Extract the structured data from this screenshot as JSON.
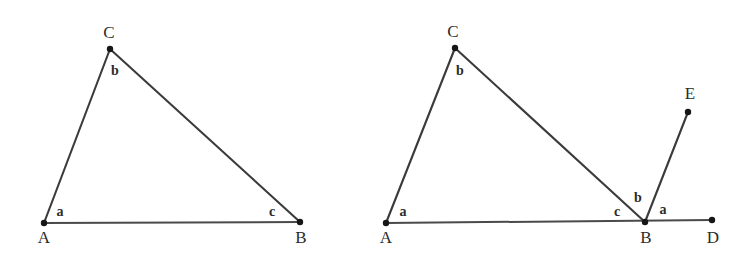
{
  "page": {
    "background_color": "#ffffff",
    "width": 754,
    "height": 260,
    "line_color": "#3b3b3b",
    "label_color": "#2b2b2b",
    "dot_color": "#161616"
  },
  "chart_data": {
    "type": "diagram",
    "title": "",
    "figures": [
      {
        "id": "figure-left",
        "name": "triangle-abc",
        "points": [
          {
            "id": "A",
            "label": "A",
            "x": 44,
            "y": 223,
            "label_x": 44,
            "label_y": 243,
            "dot": true
          },
          {
            "id": "B",
            "label": "B",
            "x": 300,
            "y": 222,
            "label_x": 301,
            "label_y": 243,
            "dot": true
          },
          {
            "id": "C",
            "label": "C",
            "x": 110,
            "y": 49,
            "label_x": 109,
            "label_y": 38,
            "dot": true
          }
        ],
        "segments": [
          {
            "id": "AC",
            "from": "A",
            "to": "C",
            "style": "seg"
          },
          {
            "id": "CB",
            "from": "C",
            "to": "B",
            "style": "seg"
          },
          {
            "id": "AB",
            "from": "A",
            "to": "B",
            "style": "baseline"
          }
        ],
        "angle_labels": [
          {
            "id": "left-angle-a",
            "text": "a",
            "x": 60,
            "y": 216
          },
          {
            "id": "left-angle-b",
            "text": "b",
            "x": 115,
            "y": 75
          },
          {
            "id": "left-angle-c",
            "text": "c",
            "x": 272,
            "y": 216
          }
        ]
      },
      {
        "id": "figure-right",
        "name": "triangle-abc-with-exterior-angle",
        "points": [
          {
            "id": "A",
            "label": "A",
            "x": 386,
            "y": 223,
            "label_x": 386,
            "label_y": 243,
            "dot": true
          },
          {
            "id": "B",
            "label": "B",
            "x": 645,
            "y": 222,
            "label_x": 646,
            "label_y": 243,
            "dot": true
          },
          {
            "id": "C",
            "label": "C",
            "x": 455,
            "y": 48,
            "label_x": 453,
            "label_y": 37,
            "dot": true
          },
          {
            "id": "D",
            "label": "D",
            "x": 712,
            "y": 220,
            "label_x": 713,
            "label_y": 243,
            "dot": true
          },
          {
            "id": "E",
            "label": "E",
            "x": 688,
            "y": 112,
            "label_x": 690,
            "label_y": 99,
            "dot": true
          }
        ],
        "segments": [
          {
            "id": "AC",
            "from": "A",
            "to": "C",
            "style": "seg"
          },
          {
            "id": "CB",
            "from": "C",
            "to": "B",
            "style": "seg"
          },
          {
            "id": "AD",
            "from": "A",
            "to": "D",
            "style": "baseline"
          },
          {
            "id": "BE",
            "from": "B",
            "to": "E",
            "style": "seg"
          }
        ],
        "angle_labels": [
          {
            "id": "right-angle-a-at-A",
            "text": "a",
            "x": 403,
            "y": 216
          },
          {
            "id": "right-angle-b-at-C",
            "text": "b",
            "x": 460,
            "y": 75
          },
          {
            "id": "right-angle-c-at-B",
            "text": "c",
            "x": 617,
            "y": 216
          },
          {
            "id": "right-angle-b-at-B",
            "text": "b",
            "x": 638,
            "y": 202
          },
          {
            "id": "right-angle-a-at-B",
            "text": "a",
            "x": 663,
            "y": 214
          }
        ]
      }
    ]
  }
}
